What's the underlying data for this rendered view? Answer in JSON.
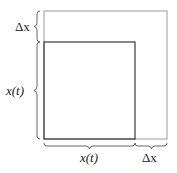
{
  "diagram": {
    "labels": {
      "top_left_delta": "Δx",
      "left_side": "x(t)",
      "bottom_side": "x(t)",
      "bottom_delta": "Δx"
    },
    "colors": {
      "outer_square": "#9a9a9a",
      "inner_square": "#3a3a3a",
      "brace": "#555555"
    }
  }
}
